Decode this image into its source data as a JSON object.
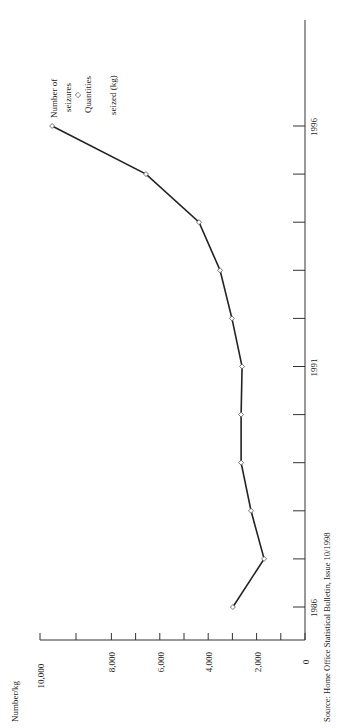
{
  "chart_data": {
    "type": "line",
    "orientation": "rotated-90-ccw",
    "title": "",
    "xlabel": "",
    "ylabel": "Number/kg",
    "categories": [
      "1986",
      "1987",
      "1988",
      "1989",
      "1990",
      "1991",
      "1992",
      "1993",
      "1994",
      "1995",
      "1996"
    ],
    "x_tick_labels": [
      "1986",
      "1991",
      "1996"
    ],
    "y_ticks": [
      0,
      2000,
      4000,
      6000,
      8000,
      10000
    ],
    "y_tick_labels": [
      "0",
      "2,000",
      "4,000",
      "6,000",
      "8,000",
      "10,000"
    ],
    "ylim": [
      0,
      10000
    ],
    "grid": false,
    "series": [
      {
        "name": "Number of seizures / Quantities seized (kg)",
        "marker": "diamond",
        "values": [
          2980,
          1690,
          2230,
          2640,
          2640,
          2600,
          3020,
          3510,
          4380,
          6570,
          10450
        ]
      }
    ],
    "legend": {
      "position": "top-left (rotated)",
      "entries": [
        "Number of seizures",
        "Quantities seized (kg)"
      ],
      "marker": "◇"
    },
    "source": "Source: Home Office Statistical Bulletin, Issue 10/1998"
  },
  "labels": {
    "ylabel": "Number/kg",
    "legend_line1": "Number of",
    "legend_line2": "seizures",
    "legend_marker": "◇",
    "legend_line3": "Quantities",
    "legend_line4": "seized (kg)",
    "source": "Source: Home Office Statistical Bulletin, Issue 10/1998"
  }
}
